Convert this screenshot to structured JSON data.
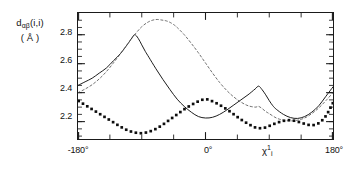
{
  "axes": {
    "ylabel_line1_prefix": "d",
    "ylabel_line1_sub": "αβ",
    "ylabel_line1_suffix": "(i,i)",
    "ylabel_line2": "( Å )",
    "yticks": [
      "2.8",
      "2.6",
      "2.4",
      "2.2"
    ],
    "xticks": [
      "-180°",
      "0°",
      "180°"
    ],
    "xaxis_symbol": "χ",
    "xaxis_sub": "i",
    "xaxis_sup": "1"
  },
  "chart_data": {
    "type": "line",
    "title": "",
    "xlabel": "χᵢ¹",
    "ylabel": "dαβ(i,i) (Å)",
    "xlim": [
      -180,
      180
    ],
    "ylim": [
      2.08,
      2.95
    ],
    "xticks": [
      -180,
      0,
      180
    ],
    "xtick_labels": [
      "-180°",
      "0°",
      "180°"
    ],
    "yticks": [
      2.2,
      2.4,
      2.6,
      2.8
    ],
    "ytick_labels": [
      "2.2",
      "2.4",
      "2.6",
      "2.8"
    ],
    "grid": false,
    "legend": "none",
    "x_minor_tick_interval": 45,
    "y_minor_tick_interval": 0.05,
    "series": [
      {
        "name": "solid-curve",
        "style": "solid",
        "color": "#1a1a1a",
        "x": [
          -180,
          -170,
          -160,
          -150,
          -140,
          -130,
          -120,
          -110,
          -105,
          -100,
          -95,
          -90,
          -85,
          -80,
          -70,
          -60,
          -50,
          -40,
          -30,
          -20,
          -10,
          0,
          10,
          20,
          30,
          40,
          50,
          60,
          70,
          75,
          80,
          85,
          90,
          95,
          100,
          110,
          120,
          130,
          140,
          150,
          160,
          170,
          180
        ],
        "y": [
          2.45,
          2.475,
          2.5,
          2.535,
          2.57,
          2.62,
          2.67,
          2.735,
          2.77,
          2.8,
          2.775,
          2.73,
          2.685,
          2.645,
          2.565,
          2.49,
          2.42,
          2.355,
          2.305,
          2.265,
          2.235,
          2.225,
          2.23,
          2.25,
          2.28,
          2.315,
          2.35,
          2.385,
          2.425,
          2.445,
          2.42,
          2.385,
          2.345,
          2.31,
          2.285,
          2.25,
          2.228,
          2.222,
          2.235,
          2.265,
          2.31,
          2.375,
          2.44
        ]
      },
      {
        "name": "dashed-curve",
        "style": "dashed",
        "color": "#555555",
        "x": [
          -180,
          -170,
          -160,
          -150,
          -140,
          -130,
          -120,
          -110,
          -100,
          -90,
          -80,
          -70,
          -60,
          -55,
          -50,
          -45,
          -40,
          -30,
          -20,
          -10,
          0,
          10,
          20,
          30,
          40,
          50,
          60,
          70,
          75,
          80,
          85,
          90,
          100,
          110,
          120,
          130,
          140,
          150,
          160,
          170,
          180
        ],
        "y": [
          2.4,
          2.425,
          2.455,
          2.495,
          2.545,
          2.605,
          2.67,
          2.735,
          2.8,
          2.855,
          2.89,
          2.905,
          2.9,
          2.895,
          2.885,
          2.87,
          2.85,
          2.8,
          2.74,
          2.675,
          2.605,
          2.535,
          2.47,
          2.415,
          2.37,
          2.335,
          2.31,
          2.3,
          2.305,
          2.29,
          2.27,
          2.255,
          2.225,
          2.21,
          2.205,
          2.21,
          2.225,
          2.255,
          2.295,
          2.345,
          2.4
        ]
      },
      {
        "name": "dotted-curve",
        "style": "dotted",
        "color": "#0d0d0d",
        "x": [
          -180,
          -170,
          -160,
          -150,
          -140,
          -130,
          -120,
          -110,
          -100,
          -90,
          -80,
          -70,
          -60,
          -50,
          -40,
          -30,
          -20,
          -10,
          0,
          10,
          20,
          30,
          40,
          50,
          60,
          70,
          75,
          80,
          85,
          90,
          100,
          110,
          120,
          130,
          140,
          150,
          160,
          170,
          180
        ],
        "y": [
          2.345,
          2.315,
          2.285,
          2.255,
          2.225,
          2.195,
          2.165,
          2.14,
          2.125,
          2.12,
          2.13,
          2.15,
          2.18,
          2.215,
          2.25,
          2.285,
          2.315,
          2.34,
          2.355,
          2.34,
          2.315,
          2.285,
          2.25,
          2.215,
          2.185,
          2.16,
          2.155,
          2.155,
          2.16,
          2.17,
          2.19,
          2.205,
          2.21,
          2.2,
          2.185,
          2.175,
          2.19,
          2.24,
          2.33
        ]
      }
    ]
  }
}
